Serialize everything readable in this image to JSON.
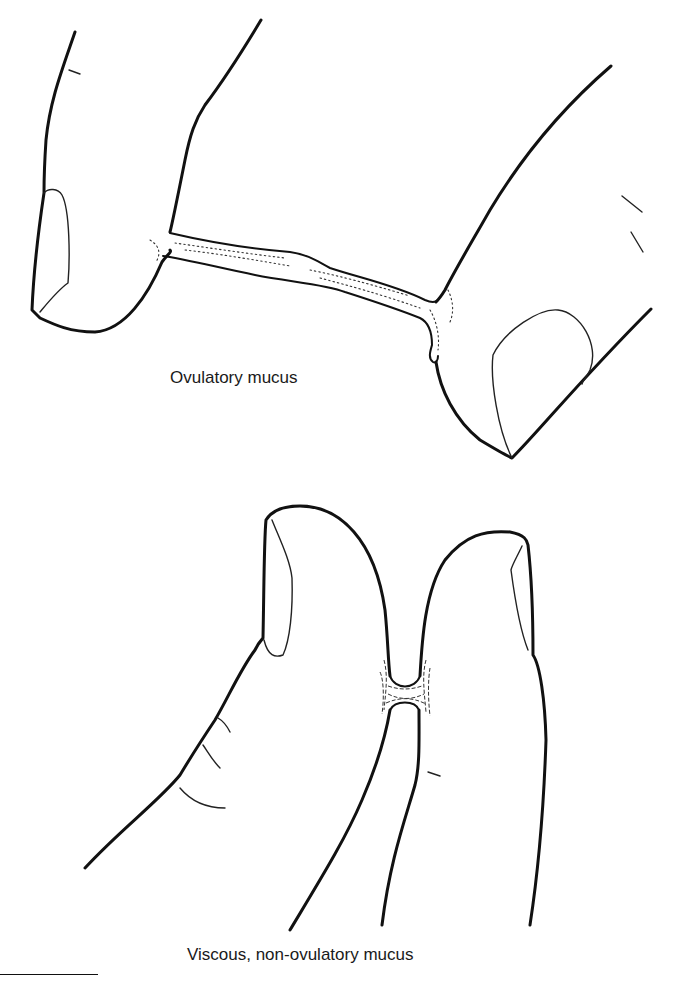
{
  "figure": {
    "panels": [
      {
        "id": "top",
        "caption": "Ovulatory mucus",
        "description": "Two fingertips pulled apart with a long stretched strand of mucus between them"
      },
      {
        "id": "bottom",
        "caption": "Viscous, non-ovulatory mucus",
        "description": "Two fingertips close together with a short, thick band of mucus between them"
      }
    ],
    "colors": {
      "line": "#111111",
      "background": "#ffffff"
    }
  }
}
